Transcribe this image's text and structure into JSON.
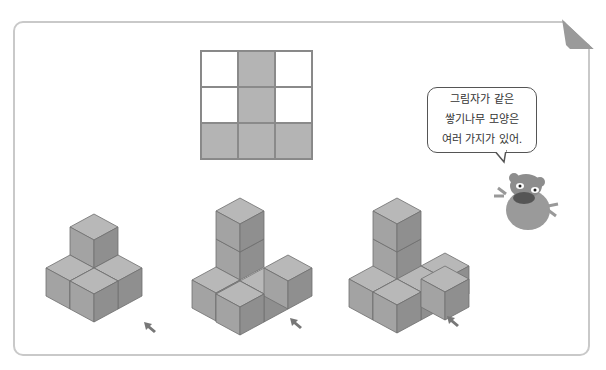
{
  "speech_bubble": {
    "lines": [
      "그림자가 같은",
      "쌓기나무 모양은",
      "여러 가지가 있어."
    ]
  },
  "shadow_grid": {
    "rows": 3,
    "cols": 3,
    "filled": [
      [
        0,
        1,
        0
      ],
      [
        0,
        1,
        0
      ],
      [
        1,
        1,
        1
      ]
    ]
  },
  "figures": [
    {
      "name": "figure-1",
      "description": "5 cubes: 2-high column with L base"
    },
    {
      "name": "figure-2",
      "description": "6 cubes"
    },
    {
      "name": "figure-3",
      "description": "7 cubes"
    }
  ],
  "colors": {
    "cube_top": "#b8b8b8",
    "cube_left": "#a2a2a2",
    "cube_right": "#8e8e8e",
    "grid_fill": "#b4b4b4"
  }
}
